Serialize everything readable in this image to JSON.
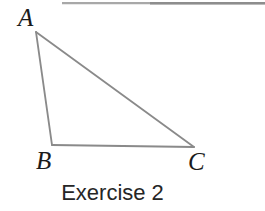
{
  "figure": {
    "caption": "Exercise 2",
    "background_color": "#ffffff",
    "stroke_color": "#8a8a8a",
    "label_color": "#1b1b1b",
    "caption_color": "#262626",
    "top_rule": {
      "name": "page-edge-rule",
      "color": "#9a9a9a",
      "x1": 62,
      "y1": 3,
      "x2": 265,
      "y2": 3
    },
    "shape": {
      "type": "triangle",
      "name": "triangle-abc",
      "vertices": [
        {
          "label": "A",
          "x": 36,
          "y": 32
        },
        {
          "label": "B",
          "x": 52,
          "y": 145
        },
        {
          "label": "C",
          "x": 194,
          "y": 147
        }
      ],
      "edges": [
        {
          "name": "side-ab",
          "from": "A",
          "to": "B"
        },
        {
          "name": "side-bc",
          "from": "B",
          "to": "C"
        },
        {
          "name": "side-ca",
          "from": "C",
          "to": "A"
        }
      ]
    },
    "labels": {
      "a": "A",
      "b": "B",
      "c": "C"
    }
  }
}
